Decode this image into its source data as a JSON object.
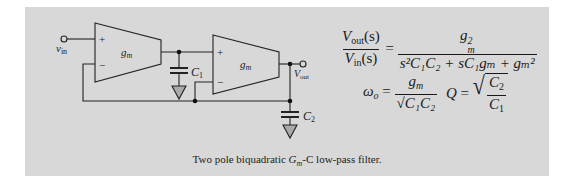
{
  "figure": {
    "background_color": "#d8d8d8",
    "stroke_color": "#222222",
    "circuit": {
      "amplifiers": [
        {
          "id": "amp1",
          "label": "g",
          "label_sub": "m",
          "plus": "+",
          "minus": "−"
        },
        {
          "id": "amp2",
          "label": "g",
          "label_sub": "m",
          "plus": "+",
          "minus": "−"
        }
      ],
      "input_label": "v",
      "input_sub": "in",
      "output_label": "V",
      "output_sub": "out",
      "capacitors": [
        {
          "id": "C1",
          "label": "C",
          "label_sub": "1"
        },
        {
          "id": "C2",
          "label": "C",
          "label_sub": "2"
        }
      ]
    },
    "equations": {
      "transfer": {
        "lhs_num": "V",
        "lhs_num_sub": "out",
        "lhs_num_arg": "(s)",
        "lhs_den": "V",
        "lhs_den_sub": "in",
        "lhs_den_arg": "(s)",
        "equals": "=",
        "rhs_num": "g",
        "rhs_num_sub": "m",
        "rhs_num_sup": "2",
        "rhs_den": "s²C₁C₂ + sC₁gₘ + gₘ²"
      },
      "omega": {
        "lhs": "ω",
        "lhs_sub": "o",
        "equals": "=",
        "num": "g",
        "num_sub": "m",
        "den_sqrt": "C₁C₂"
      },
      "q": {
        "lhs": "Q",
        "equals": "=",
        "num": "C",
        "num_sub": "2",
        "den": "C",
        "den_sub": "1"
      }
    },
    "caption": {
      "prefix": "Two pole biquadratic ",
      "gm": "G",
      "gm_sub": "m",
      "suffix": "-C low-pass filter."
    }
  }
}
